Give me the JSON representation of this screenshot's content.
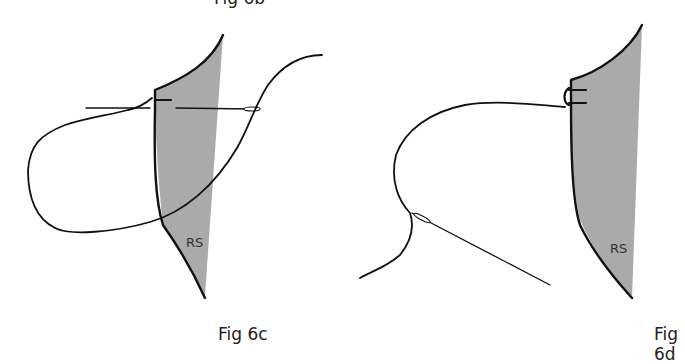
{
  "top_caption_fragment": "Fig 6b",
  "figures": [
    {
      "id": "fig-6c",
      "caption": "Fig 6c",
      "fabric_label": "RS",
      "fabric_color": "#aaaaaa"
    },
    {
      "id": "fig-6d",
      "caption": "Fig 6d",
      "fabric_label": "RS",
      "fabric_color": "#aaaaaa"
    }
  ]
}
